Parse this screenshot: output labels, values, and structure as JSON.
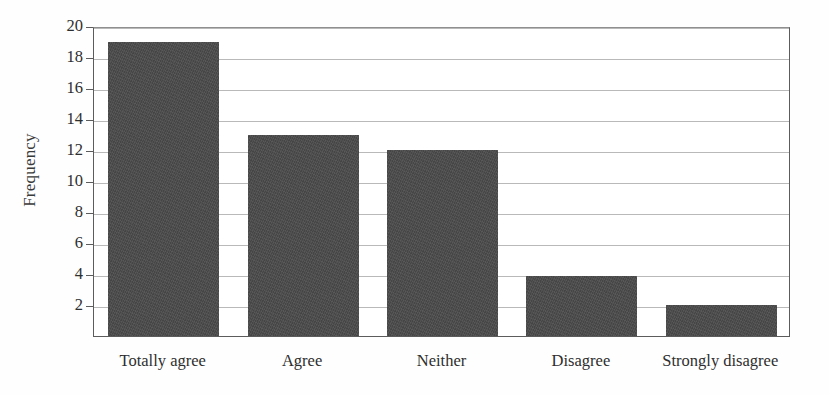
{
  "chart_data": {
    "type": "bar",
    "title": "",
    "xlabel": "",
    "ylabel": "Frequency",
    "categories": [
      "Totally agree",
      "Agree",
      "Neither",
      "Disagree",
      "Strongly disagree"
    ],
    "values": [
      19,
      13,
      12,
      3.9,
      2
    ],
    "ylim": [
      0,
      20
    ],
    "ytick_step": 2,
    "yticks": [
      2,
      4,
      6,
      8,
      10,
      12,
      14,
      16,
      18,
      20
    ],
    "ytick_labels": [
      "2",
      "4",
      "6",
      "8",
      "10",
      "12",
      "14",
      "16",
      "18",
      "20"
    ],
    "grid": true,
    "grid_axis": "y",
    "legend": false,
    "bar_color": "#4c4c4c",
    "axis_color": "#5c5c5c",
    "gridline_color": "#b9b9b9",
    "background_color": "#ffffff"
  }
}
